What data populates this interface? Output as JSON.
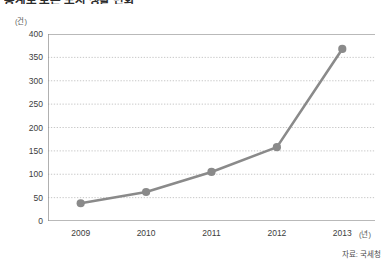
{
  "title": "통계로 보는 도시 생활 변화",
  "source_note": "자료: 국세청",
  "axes": {
    "y_unit": "(건)",
    "x_unit": "(년)"
  },
  "colors": {
    "line": "#8a8a8a",
    "marker": "#8a8a8a",
    "grid": "#b9b9b9",
    "axis": "#8f8f8f",
    "text": "#3d3d3d"
  },
  "chart_data": {
    "type": "line",
    "title": "통계로 보는 도시 생활 변화",
    "xlabel": "(년)",
    "ylabel": "(건)",
    "categories": [
      "2009",
      "2010",
      "2011",
      "2012",
      "2013"
    ],
    "values": [
      38,
      62,
      105,
      158,
      368
    ],
    "series": [
      {
        "name": "건수",
        "values": [
          38,
          62,
          105,
          158,
          368
        ]
      }
    ],
    "ylim": [
      0,
      400
    ],
    "ytick_step": 50,
    "yticks": [
      400,
      350,
      300,
      250,
      200,
      150,
      100,
      50,
      0
    ],
    "ytick_labels": [
      "400",
      "350",
      "300",
      "250",
      "200",
      "150",
      "100",
      "50",
      "0"
    ],
    "xticks": [
      "2009",
      "2010",
      "2011",
      "2012",
      "2013"
    ],
    "grid": true,
    "grid_axis": "y",
    "grid_style": "dotted",
    "legend": false,
    "legend_position": "none",
    "marker": "circle",
    "annotations": [
      "자료: 국세청"
    ]
  }
}
